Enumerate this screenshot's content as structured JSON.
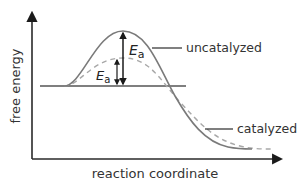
{
  "diagram": {
    "type": "reaction energy profile",
    "axes": {
      "y_label": "free energy",
      "x_label": "reaction coordinate"
    },
    "curves": [
      {
        "name": "uncatalyzed",
        "style": "solid",
        "color": "#7a7a7a",
        "peak_label": "E",
        "peak_label_sub": "a"
      },
      {
        "name": "catalyzed",
        "style": "dashed",
        "color": "#a8a8a8",
        "peak_label": "E",
        "peak_label_sub": "a"
      }
    ],
    "labels": {
      "uncatalyzed": "uncatalyzed",
      "catalyzed": "catalyzed",
      "ea_main": "E",
      "ea_main_sub": "a",
      "ea_cat": "E",
      "ea_cat_sub": "a"
    },
    "colors": {
      "axis": "#2a2a2a",
      "uncatalyzed_curve": "#7a7a7a",
      "catalyzed_curve": "#a8a8a8",
      "baseline": "#555555",
      "arrow": "#1a1a1a"
    }
  }
}
